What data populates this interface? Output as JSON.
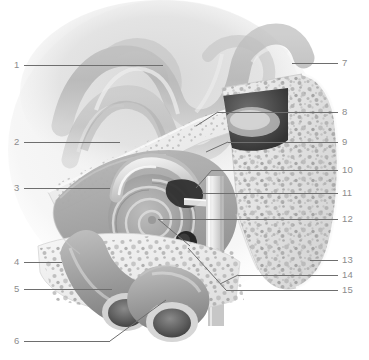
{
  "figure": {
    "type": "anatomical-illustration",
    "style": "grayscale medical illustration",
    "width": 369,
    "height": 360,
    "background_color": "#ffffff",
    "label_color": "#8c8c8c",
    "leader_color": "#6e6e6e"
  },
  "labels": {
    "left": [
      {
        "number": "1",
        "x": 14,
        "y": 60,
        "line_x1": 24,
        "line_x2": 163,
        "line_y": 65
      },
      {
        "number": "2",
        "x": 14,
        "y": 137,
        "line_x1": 24,
        "line_x2": 120,
        "line_y": 142
      },
      {
        "number": "3",
        "x": 14,
        "y": 183,
        "line_x1": 24,
        "line_x2": 110,
        "line_y": 188
      },
      {
        "number": "4",
        "x": 14,
        "y": 257,
        "line_x1": 24,
        "line_x2": 62,
        "line_y": 262
      },
      {
        "number": "5",
        "x": 14,
        "y": 284,
        "line_x1": 24,
        "line_x2": 112,
        "line_y": 289
      },
      {
        "number": "6",
        "x": 14,
        "y": 336,
        "line_x1": 24,
        "line_x2": 110,
        "line_y": 341
      }
    ],
    "right": [
      {
        "number": "7",
        "x": 342,
        "y": 58,
        "line_x1": 292,
        "line_x2": 338,
        "line_y": 63
      },
      {
        "number": "8",
        "x": 342,
        "y": 107,
        "line_x1": 218,
        "line_x2": 338,
        "line_y": 112
      },
      {
        "number": "9",
        "x": 342,
        "y": 137,
        "line_x1": 228,
        "line_x2": 338,
        "line_y": 142
      },
      {
        "number": "10",
        "x": 342,
        "y": 165,
        "line_x1": 212,
        "line_x2": 338,
        "line_y": 170
      },
      {
        "number": "11",
        "x": 342,
        "y": 188,
        "line_x1": 202,
        "line_x2": 338,
        "line_y": 193
      },
      {
        "number": "12",
        "x": 342,
        "y": 214,
        "line_x1": 158,
        "line_x2": 338,
        "line_y": 219
      },
      {
        "number": "13",
        "x": 342,
        "y": 255,
        "line_x1": 310,
        "line_x2": 338,
        "line_y": 260
      },
      {
        "number": "14",
        "x": 342,
        "y": 270,
        "line_x1": 238,
        "line_x2": 338,
        "line_y": 275
      },
      {
        "number": "15",
        "x": 342,
        "y": 285,
        "line_x1": 226,
        "line_x2": 338,
        "line_y": 290
      }
    ]
  },
  "regions": [
    {
      "name": "cerebral-cortex-gyri",
      "note": "wavy brain folds upper left, soft gray, vignetted"
    },
    {
      "name": "dura-and-skull-plate",
      "note": "diagonal layered bone band"
    },
    {
      "name": "mastoid-air-cells",
      "note": "speckled porous bone, right side"
    },
    {
      "name": "middle-ear-cavity",
      "note": "dark cavity with ossicles"
    },
    {
      "name": "cochlea-spiral",
      "note": "central spiral coil"
    },
    {
      "name": "semicircular-canal",
      "note": "curved tube above cochlea"
    },
    {
      "name": "internal-carotid-and-jugular",
      "note": "large tubular vessels lower left"
    },
    {
      "name": "eustachian-tube",
      "note": "vertical tube lower right"
    }
  ]
}
